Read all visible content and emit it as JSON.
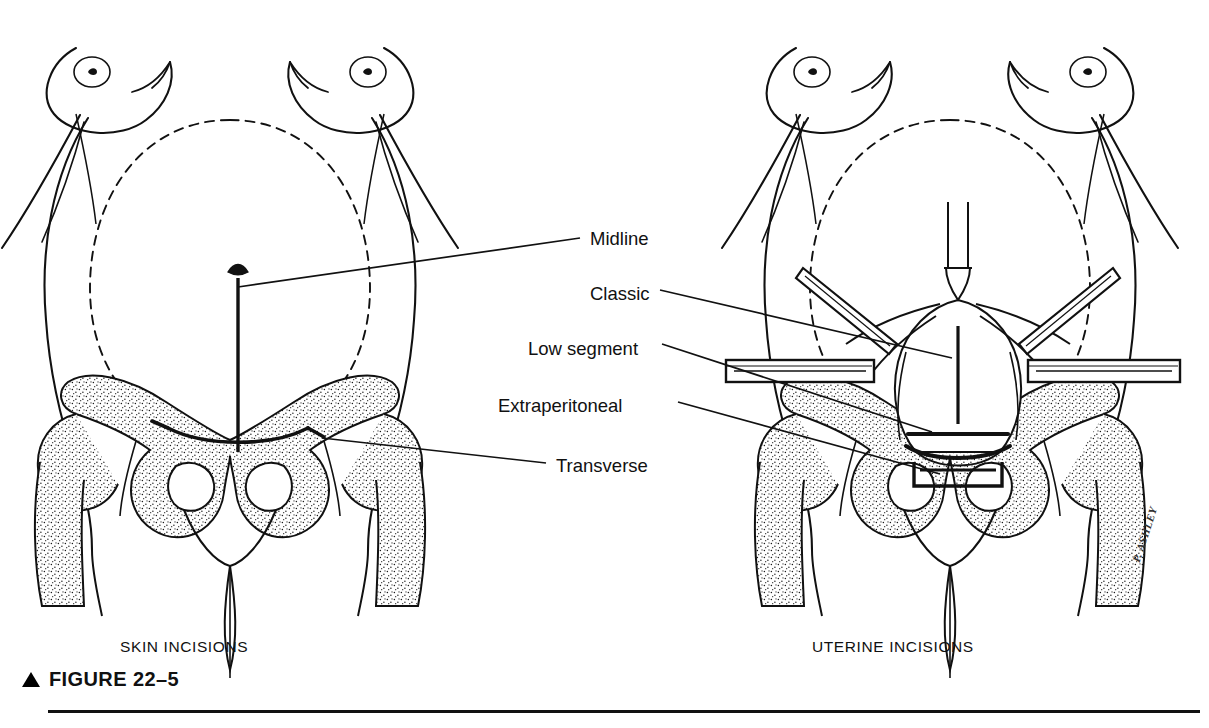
{
  "figure": {
    "number_label": "FIGURE 22–5",
    "marker_icon": "triangle-up-icon",
    "signature": "P. ASHLEY",
    "rule_color": "#111111",
    "ink_color": "#111111",
    "background_color": "#ffffff"
  },
  "panels": [
    {
      "id": "left",
      "caption": "SKIN INCISIONS"
    },
    {
      "id": "right",
      "caption": "UTERINE INCISIONS"
    }
  ],
  "labels": [
    {
      "id": "midline",
      "text": "Midline",
      "panel": "left",
      "x": 590,
      "y": 228
    },
    {
      "id": "classic",
      "text": "Classic",
      "panel": "right",
      "x": 590,
      "y": 283
    },
    {
      "id": "low-segment",
      "text": "Low segment",
      "panel": "right",
      "x": 528,
      "y": 338
    },
    {
      "id": "extraperitoneal",
      "text": "Extraperitoneal",
      "panel": "right",
      "x": 498,
      "y": 395
    },
    {
      "id": "transverse",
      "text": "Transverse",
      "panel": "left",
      "x": 556,
      "y": 455
    }
  ],
  "anatomy": {
    "left_panel_features": [
      "female-torso-outline",
      "breasts-with-nipples",
      "gravid-uterus-dashed-outline",
      "umbilicus",
      "pelvis-stippled-bone",
      "femoral-heads",
      "obturator-foramina",
      "pubic-symphysis",
      "midline-vertical-incision",
      "transverse-pfannenstiel-incision"
    ],
    "right_panel_features": [
      "female-torso-outline",
      "breasts-with-nipples",
      "gravid-uterus-dashed-outline",
      "exposed-uterus",
      "fallopian-tubes",
      "round-ligaments",
      "retractor-blades",
      "angled-forceps",
      "classic-vertical-uterine-incision",
      "low-segment-transverse-incision",
      "extraperitoneal-incision-bracket",
      "pelvis-stippled-bone"
    ]
  }
}
